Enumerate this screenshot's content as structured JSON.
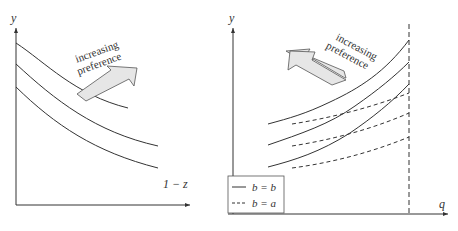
{
  "left_panel": {
    "y_label": "y",
    "x_label": "1 − z",
    "annotation_line1": "increasing",
    "annotation_line2": "preference",
    "arrow_icon": "block-arrow-up-right-icon",
    "curves": [
      {
        "name": "indifference-curve-1",
        "style": "solid"
      },
      {
        "name": "indifference-curve-2",
        "style": "solid"
      },
      {
        "name": "indifference-curve-3",
        "style": "solid"
      }
    ]
  },
  "right_panel": {
    "y_label": "y",
    "x_label": "q",
    "annotation_line1": "increasing",
    "annotation_line2": "preference",
    "arrow_icon": "block-arrow-up-left-icon",
    "vertical_bound": "dashed",
    "legend": [
      {
        "style": "solid",
        "label": "b = b"
      },
      {
        "style": "dashed",
        "label": "b = a"
      }
    ]
  },
  "colors": {
    "line": "#333333",
    "arrow_fill": "#e6e6e6",
    "arrow_stroke": "#555555"
  }
}
